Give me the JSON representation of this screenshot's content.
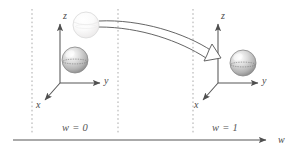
{
  "figure": {
    "background": "#ffffff",
    "line_color": "#5a5a5a",
    "dash_color": "#9a9a9a",
    "sphere_fill": "#c9c9c9",
    "ghost_fill": "#f4f4f4",
    "width": 300,
    "height": 157
  },
  "frames": {
    "left": {
      "name": "frame-w0",
      "origin": {
        "x": 60,
        "y": 83
      },
      "axes": [
        {
          "name": "z-axis",
          "label": "z",
          "label_x": 63,
          "label_y": 12
        },
        {
          "name": "y-axis",
          "label": "y",
          "label_x": 108,
          "label_y": 76
        },
        {
          "name": "x-axis",
          "label": "x",
          "label_x": 36,
          "label_y": 105
        }
      ],
      "plane_label": "w = 0",
      "plane_label_x": 80,
      "plane_label_y": 126
    },
    "right": {
      "name": "frame-w1",
      "origin": {
        "x": 218,
        "y": 83
      },
      "axes": [
        {
          "name": "z-axis",
          "label": "z",
          "label_x": 221,
          "label_y": 12
        },
        {
          "name": "y-axis",
          "label": "y",
          "label_x": 266,
          "label_y": 76
        },
        {
          "name": "x-axis",
          "label": "x",
          "label_x": 194,
          "label_y": 105
        }
      ],
      "plane_label": "w = 1",
      "plane_label_x": 215,
      "plane_label_y": 126
    }
  },
  "w_axis": {
    "label": "w",
    "label_x": 282,
    "label_y": 136,
    "start_x": 13,
    "end_x": 272,
    "y": 140
  },
  "dashed_lines": [
    {
      "name": "dashed-line-1",
      "x": 32
    },
    {
      "name": "dashed-line-2",
      "x": 118
    },
    {
      "name": "dashed-line-3",
      "x": 193
    }
  ],
  "spheres": [
    {
      "name": "sphere-source-ghost",
      "cx": 86,
      "cy": 25,
      "r": 13,
      "style": "ghost"
    },
    {
      "name": "sphere-at-origin-left",
      "cx": 75,
      "cy": 60,
      "r": 13,
      "style": "solid"
    },
    {
      "name": "sphere-at-origin-right",
      "cx": 243,
      "cy": 63,
      "r": 13,
      "style": "solid"
    }
  ],
  "motion_arrow": {
    "name": "transport-arrow",
    "description": "curved double-line arrow from ghost sphere to right frame",
    "from": {
      "x": 99,
      "y": 24
    },
    "to": {
      "x": 217,
      "y": 58
    }
  }
}
